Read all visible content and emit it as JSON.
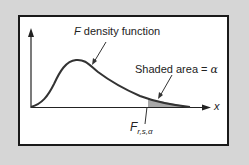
{
  "diagram": {
    "title": "F density function",
    "curve_label_italic": "F",
    "curve_label_rest": " density function",
    "shaded_label_text": "Shaded area",
    "shaded_label_eq": " = ",
    "shaded_label_symbol": "α",
    "x_axis_label": "x",
    "critical_value_main": "F",
    "critical_value_sub": "r,s,α",
    "colors": {
      "background": "#d6d6d6",
      "panel": "#ffffff",
      "border": "#1a1a1a",
      "curve": "#333333",
      "shaded": "#a8a8a8"
    }
  }
}
